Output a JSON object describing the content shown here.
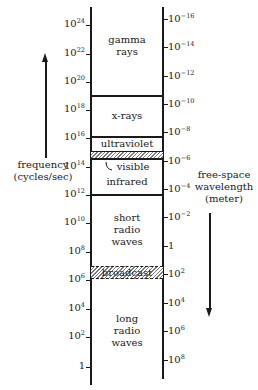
{
  "left_axis": {
    "label_line1": "frequency",
    "label_line2": "(cycles/sec)",
    "ticks": [
      {
        "base": "10",
        "exp": "24",
        "y": 25
      },
      {
        "base": "10",
        "exp": "22",
        "y": 54
      },
      {
        "base": "10",
        "exp": "20",
        "y": 82
      },
      {
        "base": "10",
        "exp": "18",
        "y": 110
      },
      {
        "base": "10",
        "exp": "16",
        "y": 138
      },
      {
        "base": "10",
        "exp": "14",
        "y": 167
      },
      {
        "base": "10",
        "exp": "12",
        "y": 195
      },
      {
        "base": "10",
        "exp": "10",
        "y": 223
      },
      {
        "base": "10",
        "exp": "8",
        "y": 252
      },
      {
        "base": "10",
        "exp": "6",
        "y": 280
      },
      {
        "base": "10",
        "exp": "4",
        "y": 309
      },
      {
        "base": "10",
        "exp": "2",
        "y": 337
      },
      {
        "base": "1",
        "exp": "",
        "y": 367
      }
    ]
  },
  "right_axis": {
    "label_line1": "free-space",
    "label_line2": "wavelength",
    "label_line3": "(meter)",
    "ticks": [
      {
        "base": "10",
        "exp": "−16",
        "y": 19
      },
      {
        "base": "10",
        "exp": "−14",
        "y": 47
      },
      {
        "base": "10",
        "exp": "−12",
        "y": 76
      },
      {
        "base": "10",
        "exp": "−10",
        "y": 104
      },
      {
        "base": "10",
        "exp": "−8",
        "y": 132
      },
      {
        "base": "10",
        "exp": "−6",
        "y": 161
      },
      {
        "base": "10",
        "exp": "−4",
        "y": 189
      },
      {
        "base": "10",
        "exp": "−2",
        "y": 217
      },
      {
        "base": "1",
        "exp": "",
        "y": 246
      },
      {
        "base": "10",
        "exp": "2",
        "y": 274
      },
      {
        "base": "10",
        "exp": "4",
        "y": 303
      },
      {
        "base": "10",
        "exp": "6",
        "y": 331
      },
      {
        "base": "10",
        "exp": "8",
        "y": 360
      }
    ]
  },
  "bands": {
    "gamma_line1": "gamma",
    "gamma_line2": "rays",
    "xrays": "x-rays",
    "ultraviolet": "ultraviolet",
    "visible": "visible",
    "infrared": "infrared",
    "short_radio_line1": "short",
    "short_radio_line2": "radio",
    "short_radio_line3": "waves",
    "broadcast": "broadcast",
    "long_radio_line1": "long",
    "long_radio_line2": "radio",
    "long_radio_line3": "waves"
  },
  "colors": {
    "ink": "#1a1a1a",
    "hatch": "#7a7a7a",
    "background": "#ffffff"
  }
}
